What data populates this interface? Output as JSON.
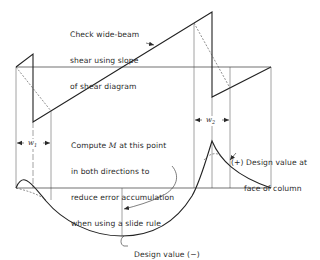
{
  "annotations": {
    "wide_beam": {
      "line1": "Check wide-beam",
      "line2": "shear using slope",
      "line3": "of shear diagram"
    },
    "compute_m": {
      "line1_pre": "Compute ",
      "line1_var": "M",
      "line1_post": " at this point",
      "line2": "in both directions to",
      "line3": "reduce error accumulation",
      "line4": "when using a slide rule"
    },
    "design_positive": {
      "line1": "(+) Design value at",
      "line2": "face of column"
    },
    "design_negative": "Design value (−)"
  },
  "dimensions": {
    "w1": {
      "symbol": "w",
      "subscript": "1"
    },
    "w2": {
      "symbol": "w",
      "subscript": "2"
    }
  },
  "diagrams": {
    "shear": "shear-diagram",
    "moment": "moment-diagram"
  },
  "colors": {
    "line": "#2a2a2a",
    "thin": "#555555",
    "background": "#ffffff"
  }
}
